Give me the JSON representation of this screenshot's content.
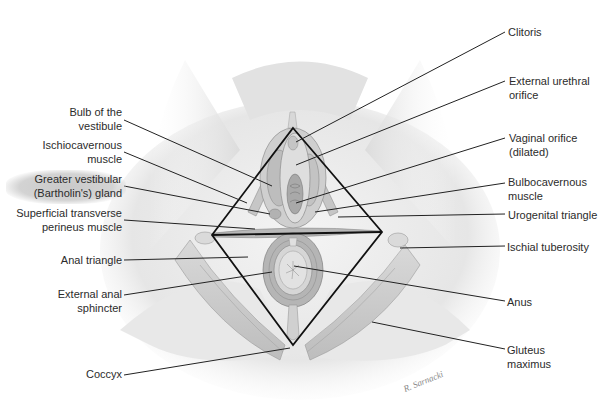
{
  "figure": {
    "signature": "R. Sarnacki",
    "diamond": {
      "top": [
        293,
        128
      ],
      "left": [
        212,
        235
      ],
      "right": [
        382,
        232
      ],
      "bottom": [
        293,
        345
      ]
    }
  },
  "labels_left": [
    {
      "line1": "Bulb of the",
      "line2": "vestibule"
    },
    {
      "line1": "Ischiocavernous",
      "line2": "muscle"
    },
    {
      "line1": "Greater vestibular",
      "line2": "(Bartholin's) gland"
    },
    {
      "line1": "Superficial transverse",
      "line2": "perineus muscle"
    },
    {
      "line1": "Anal triangle",
      "line2": ""
    },
    {
      "line1": "External anal",
      "line2": "sphincter"
    },
    {
      "line1": "Coccyx",
      "line2": ""
    }
  ],
  "labels_right": [
    {
      "line1": "Clitoris",
      "line2": ""
    },
    {
      "line1": "External urethral",
      "line2": "orifice"
    },
    {
      "line1": "Vaginal orifice",
      "line2": "(dilated)"
    },
    {
      "line1": "Bulbocavernous",
      "line2": "muscle"
    },
    {
      "line1": "Urogenital triangle",
      "line2": ""
    },
    {
      "line1": "Ischial tuberosity",
      "line2": ""
    },
    {
      "line1": "Anus",
      "line2": ""
    },
    {
      "line1": "Gluteus",
      "line2": "maximus"
    }
  ]
}
